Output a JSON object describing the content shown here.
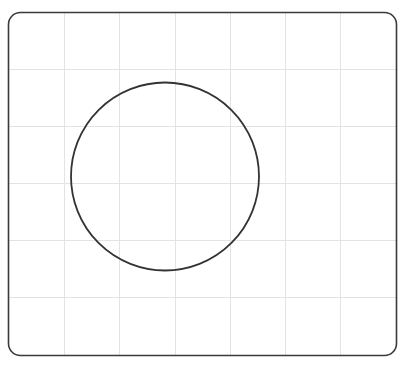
{
  "canvas": {
    "width": 408,
    "height": 368,
    "background": "#ffffff"
  },
  "frame": {
    "x": 8.5,
    "y": 12.5,
    "width": 388,
    "height": 343,
    "corner_radius": 12,
    "stroke": "#3a3a3a",
    "stroke_width": 1.6
  },
  "grid": {
    "color": "#e3e3e3",
    "vertical_lines_x": [
      64,
      119,
      175,
      230,
      285,
      340
    ],
    "horizontal_lines_y": [
      69,
      126,
      183,
      240,
      297
    ]
  },
  "shapes": [
    {
      "type": "circle",
      "cx": 165,
      "cy": 176.5,
      "r": 94,
      "stroke": "#333333",
      "stroke_width": 1.8,
      "fill": "none"
    }
  ]
}
